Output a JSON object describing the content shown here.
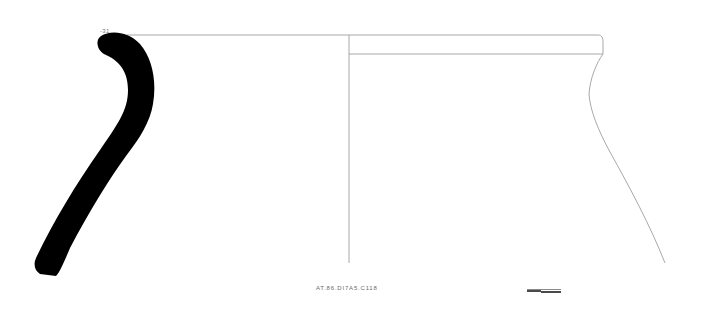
{
  "drawing": {
    "type": "pottery-profile",
    "rim_marker_label": "-31",
    "catalog_label": "AT.86.DI7A5.C118",
    "scale_bar": {
      "segments": 2
    },
    "colors": {
      "profile_fill": "#000000",
      "outline": "#9a9a9a",
      "background": "#ffffff"
    }
  }
}
